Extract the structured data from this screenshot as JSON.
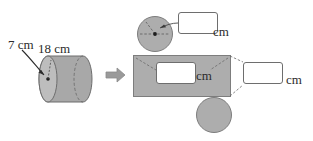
{
  "figure": {
    "solid": {
      "name": "cylinder",
      "radius_label": "7 cm",
      "length_label": "18 cm"
    },
    "transform_arrow": "right-arrow",
    "net": {
      "rectangle_unit": "cm",
      "rectangle_answer_value": "",
      "rectangle_answer_placeholder": "",
      "height_unit": "cm",
      "height_answer_value": "",
      "height_answer_placeholder": "",
      "radius_unit": "cm",
      "radius_answer_value": "",
      "radius_answer_placeholder": ""
    },
    "colors": {
      "shape_fill": "#adadad",
      "shape_stroke": "#7d7d7d",
      "text": "#2b2b2b",
      "box_border": "#6e6e6e",
      "arrow": "#8c8c8c",
      "background": "#ffffff"
    }
  }
}
